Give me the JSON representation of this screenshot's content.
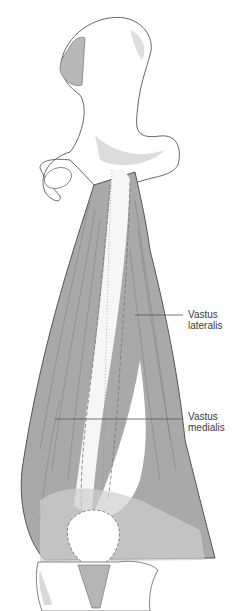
{
  "figure": {
    "labels": [
      {
        "line1": "Vastus",
        "line2": "lateralis"
      },
      {
        "line1": "Vastus",
        "line2": "medialis"
      }
    ],
    "colors": {
      "muscle": "#a9a9a9",
      "bone": "#ffffff",
      "bone_shade": "#dcdcdc",
      "outline": "#555555",
      "text": "#3a3a3a"
    }
  }
}
